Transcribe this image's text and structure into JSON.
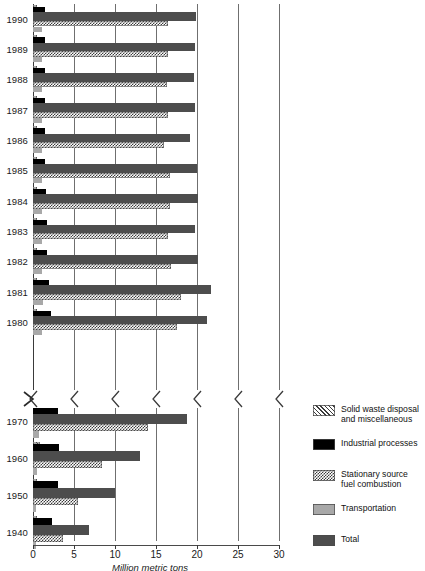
{
  "chart_data": {
    "type": "bar",
    "orientation": "horizontal",
    "title": "",
    "xlabel": "Million metric tons",
    "ylabel": "",
    "xlim": [
      0,
      30
    ],
    "xticks": [
      0,
      5,
      10,
      15,
      20,
      25,
      30
    ],
    "xtick_labels": [
      "0",
      "5",
      "10",
      "15",
      "20",
      "25",
      "30"
    ],
    "grid": true,
    "grid_axis": "x",
    "legend_position": "right",
    "axis_break": {
      "present": true,
      "between_categories": [
        "1980",
        "1970"
      ],
      "note": "y-axis scale break between 1980 and 1970"
    },
    "categories": [
      "1990",
      "1989",
      "1988",
      "1987",
      "1986",
      "1985",
      "1984",
      "1983",
      "1982",
      "1981",
      "1980",
      "1970",
      "1960",
      "1950",
      "1940"
    ],
    "series": [
      {
        "name": "Solid waste disposal and miscellaneous",
        "pattern": "diagonal-hatch",
        "color": "#ffffff",
        "values": [
          0.5,
          0.5,
          0.5,
          0.5,
          0.5,
          0.5,
          0.5,
          0.5,
          0.5,
          0.5,
          0.5,
          0.7,
          0.8,
          0.5,
          0.5
        ]
      },
      {
        "name": "Industrial processes",
        "pattern": "solid",
        "color": "#000000",
        "values": [
          1.4,
          1.4,
          1.5,
          1.5,
          1.5,
          1.5,
          1.6,
          1.7,
          1.7,
          2.0,
          2.2,
          3.1,
          3.2,
          3.0,
          2.3
        ]
      },
      {
        "name": "Total",
        "pattern": "solid",
        "color": "#4d4d4d",
        "values": [
          19.9,
          19.7,
          19.6,
          19.7,
          19.2,
          20.0,
          20.1,
          19.8,
          20.1,
          21.7,
          21.2,
          18.8,
          13.0,
          10.0,
          6.8
        ]
      },
      {
        "name": "Stationary source fuel combustion",
        "pattern": "checkerboard",
        "color": "#ffffff",
        "values": [
          16.5,
          16.4,
          16.3,
          16.5,
          16.0,
          16.7,
          16.7,
          16.5,
          16.8,
          18.1,
          17.5,
          14.0,
          8.4,
          5.5,
          3.7
        ]
      },
      {
        "name": "Transportation",
        "pattern": "solid",
        "color": "#a8a8a8",
        "values": [
          1.1,
          1.1,
          1.1,
          1.1,
          1.1,
          1.1,
          1.1,
          1.1,
          1.1,
          1.2,
          1.1,
          0.7,
          0.5,
          0.4,
          0.3
        ]
      }
    ]
  },
  "axis": {
    "x_title": "Million metric tons",
    "tick_labels": [
      "0",
      "5",
      "10",
      "15",
      "20",
      "25",
      "30"
    ]
  },
  "year_labels": [
    "1990",
    "1989",
    "1988",
    "1987",
    "1986",
    "1985",
    "1984",
    "1983",
    "1982",
    "1981",
    "1980",
    "1970",
    "1960",
    "1950",
    "1940"
  ],
  "legend": {
    "items": [
      {
        "label_line1": "Solid waste disposal",
        "label_line2": "and miscellaneous",
        "swatch": "diagonal-hatch"
      },
      {
        "label_line1": "Industrial processes",
        "label_line2": "",
        "swatch": "black-solid"
      },
      {
        "label_line1": "Stationary source",
        "label_line2": "fuel combustion",
        "swatch": "checkerboard"
      },
      {
        "label_line1": "Transportation",
        "label_line2": "",
        "swatch": "light-gray-solid"
      },
      {
        "label_line1": "Total",
        "label_line2": "",
        "swatch": "dark-gray-solid"
      }
    ]
  },
  "colors": {
    "total": "#4d4d4d",
    "transportation": "#a8a8a8",
    "industrial": "#000000",
    "hatch_ink": "#3b3b3b",
    "grid": "#6f6f6f"
  }
}
